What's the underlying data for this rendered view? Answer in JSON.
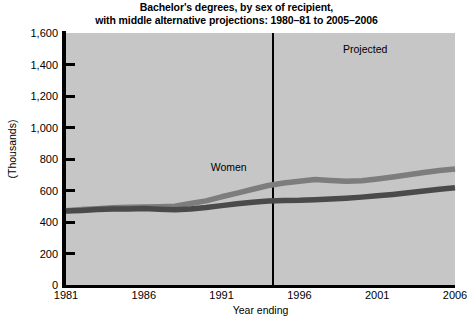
{
  "chart_data": {
    "type": "line",
    "title": "Bachelor's degrees, by sex of recipient,\nwith middle alternative projections: 1980–81 to 2005–2006",
    "xlabel": "Year ending",
    "ylabel": "(Thousands)",
    "xlim": [
      1981,
      2006
    ],
    "ylim": [
      0,
      1600
    ],
    "grid": false,
    "legend_position": "inline-annotation",
    "background_color": "#c6c6c6",
    "x_ticks": [
      "1981",
      "1986",
      "1991",
      "1996",
      "2001",
      "2006"
    ],
    "x_tick_values": [
      1981,
      1986,
      1991,
      1996,
      2001,
      2006
    ],
    "y_ticks": [
      "0",
      "200",
      "400",
      "600",
      "800",
      "1,000",
      "1,200",
      "1,400",
      "1,600"
    ],
    "y_tick_values": [
      0,
      200,
      400,
      600,
      800,
      1000,
      1200,
      1400,
      1600
    ],
    "x": [
      1981,
      1982,
      1983,
      1984,
      1985,
      1986,
      1987,
      1988,
      1989,
      1990,
      1991,
      1992,
      1993,
      1994,
      1995,
      1996,
      1997,
      1998,
      1999,
      2000,
      2001,
      2002,
      2003,
      2004,
      2005,
      2006
    ],
    "series": [
      {
        "name": "Women",
        "color": "#7d7d7d",
        "values": [
          471,
          479,
          484,
          491,
          493,
          495,
          497,
          500,
          517,
          534,
          560,
          583,
          608,
          632,
          648,
          659,
          670,
          664,
          659,
          662,
          673,
          686,
          700,
          714,
          727,
          736
        ]
      },
      {
        "name": "Men",
        "color": "#4a4a4a",
        "values": [
          470,
          473,
          479,
          482,
          483,
          486,
          481,
          478,
          483,
          492,
          504,
          516,
          525,
          533,
          537,
          538,
          542,
          546,
          551,
          558,
          566,
          575,
          586,
          597,
          608,
          618
        ]
      }
    ],
    "annotations": [
      {
        "name": "women-label",
        "text": "Women",
        "x": 1990.3,
        "y": 750
      },
      {
        "name": "projected-label",
        "text": "Projected",
        "x": 1998.8,
        "y": 1500
      }
    ],
    "divider": {
      "name": "projection-divider",
      "x": 1994.3,
      "label": "actual/projected boundary"
    }
  },
  "axis": {
    "y_label": "(Thousands)",
    "x_label": "Year ending"
  }
}
